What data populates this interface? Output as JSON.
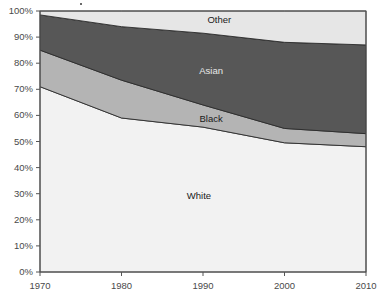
{
  "chart_data": {
    "type": "area",
    "stacked": true,
    "title": "",
    "xlabel": "",
    "ylabel": "",
    "x": [
      1970,
      1980,
      1990,
      2000,
      2010
    ],
    "xtick_labels": [
      "1970",
      "1980",
      "1990",
      "2000",
      "2010"
    ],
    "xlim": [
      1970,
      2010
    ],
    "ylim": [
      0,
      100
    ],
    "ytick_labels": [
      "0%",
      "10%",
      "20%",
      "30%",
      "40%",
      "50%",
      "60%",
      "70%",
      "80%",
      "90%",
      "100%"
    ],
    "ytick_values": [
      0,
      10,
      20,
      30,
      40,
      50,
      60,
      70,
      80,
      90,
      100
    ],
    "grid": false,
    "legend": "inline-labels",
    "series": [
      {
        "name": "White",
        "color": "#f2f2f2",
        "values": [
          71.0,
          59.0,
          55.5,
          49.5,
          48.0
        ]
      },
      {
        "name": "Black",
        "color": "#b4b4b4",
        "values": [
          14.0,
          14.5,
          8.5,
          5.5,
          5.0
        ]
      },
      {
        "name": "Asian",
        "color": "#575757",
        "values": [
          13.5,
          20.5,
          27.5,
          33.0,
          34.0
        ]
      },
      {
        "name": "Other",
        "color": "#e6e6e6",
        "values": [
          1.5,
          6.0,
          8.5,
          12.0,
          13.0
        ]
      }
    ],
    "cumulative_tops": {
      "White": [
        71.0,
        59.0,
        55.5,
        49.5,
        48.0
      ],
      "Black": [
        85.0,
        73.5,
        64.0,
        55.0,
        53.0
      ],
      "Asian": [
        98.5,
        94.0,
        91.5,
        88.0,
        87.0
      ],
      "Other": [
        100.0,
        100.0,
        100.0,
        100.0,
        100.0
      ]
    },
    "series_label_positions": [
      {
        "name": "Other",
        "x": 1992.0,
        "y": 96.5
      },
      {
        "name": "Asian",
        "x": 1991.0,
        "y": 77.0
      },
      {
        "name": "Black",
        "x": 1991.0,
        "y": 58.5
      },
      {
        "name": "White",
        "x": 1989.5,
        "y": 29.0
      }
    ]
  },
  "style": {
    "axis_color": "#555555",
    "frame_color": "#555555",
    "text_color": "#4a4a4a",
    "background": "#ffffff",
    "series_outline": "#2b2b2b"
  }
}
